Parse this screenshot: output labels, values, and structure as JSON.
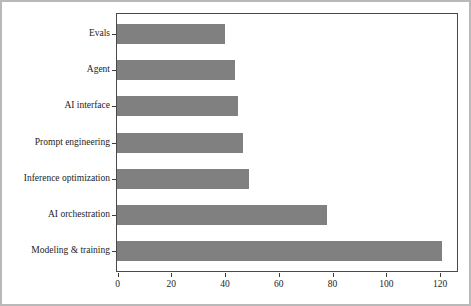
{
  "chart_data": {
    "type": "bar",
    "orientation": "horizontal",
    "title": "",
    "subtitle": "",
    "xlabel": "",
    "ylabel": "",
    "categories": [
      "Evals",
      "Agent",
      "AI interface",
      "Prompt engineering",
      "Inference optimization",
      "AI orchestration",
      "Modeling & training"
    ],
    "values": [
      40,
      44,
      45,
      47,
      49,
      78,
      121
    ],
    "xlim": [
      0,
      128
    ],
    "xticks": [
      0,
      20,
      40,
      60,
      80,
      100,
      120
    ],
    "xtick_labels": [
      "0",
      "20",
      "40",
      "60",
      "80",
      "100",
      "120"
    ],
    "grid": false,
    "legend": null,
    "bar_color": "#808080",
    "panel_border_color": "#4a4a4a",
    "background_color": "#ffffff",
    "axis_text_color": "#1d1d1d"
  },
  "figure": {
    "outer_border_color": "#b9b9b9"
  }
}
